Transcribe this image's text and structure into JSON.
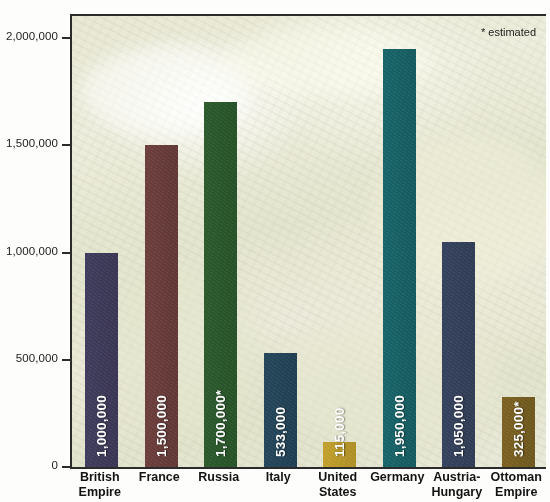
{
  "chart_data": {
    "type": "bar",
    "title": "",
    "subtitle": "",
    "xlabel": "",
    "ylabel": "",
    "ylim": [
      0,
      2000000
    ],
    "grid": false,
    "legend": "none",
    "annotations": [
      "* estimated"
    ],
    "y_ticks": [
      {
        "value": 2000000,
        "label": "2,000,000"
      },
      {
        "value": 1500000,
        "label": "1,500,000"
      },
      {
        "value": 1000000,
        "label": "1,000,000"
      },
      {
        "value": 500000,
        "label": "500,000"
      },
      {
        "value": 0,
        "label": "0"
      }
    ],
    "categories": [
      "British Empire",
      "France",
      "Russia",
      "Italy",
      "United States",
      "Germany",
      "Austria-Hungary",
      "Ottoman Empire"
    ],
    "values": [
      1000000,
      1500000,
      1700000,
      533000,
      115000,
      1950000,
      1050000,
      325000
    ],
    "data_labels": [
      "1,000,000",
      "1,500,000",
      "1,700,000*",
      "533,000",
      "115,000",
      "1,950,000",
      "1,050,000",
      "325,000*"
    ],
    "estimated_flags": [
      false,
      false,
      true,
      false,
      false,
      false,
      false,
      true
    ],
    "bar_colors": [
      "#413d5e",
      "#6e3f3d",
      "#2c5c2d",
      "#25475c",
      "#c5a22c",
      "#18666b",
      "#36435f",
      "#7d6322"
    ],
    "bars": [
      {
        "category": "British Empire",
        "label_line1": "British",
        "label_line2": "Empire",
        "value": 1000000,
        "data_label": "1,000,000",
        "color": "#413d5e"
      },
      {
        "category": "France",
        "label_line1": "France",
        "label_line2": "",
        "value": 1500000,
        "data_label": "1,500,000",
        "color": "#6e3f3d"
      },
      {
        "category": "Russia",
        "label_line1": "Russia",
        "label_line2": "",
        "value": 1700000,
        "data_label": "1,700,000*",
        "color": "#2c5c2d"
      },
      {
        "category": "Italy",
        "label_line1": "Italy",
        "label_line2": "",
        "value": 533000,
        "data_label": "533,000",
        "color": "#25475c"
      },
      {
        "category": "United States",
        "label_line1": "United",
        "label_line2": "States",
        "value": 115000,
        "data_label": "115,000",
        "color": "#c5a22c"
      },
      {
        "category": "Germany",
        "label_line1": "Germany",
        "label_line2": "",
        "value": 1950000,
        "data_label": "1,950,000",
        "color": "#18666b"
      },
      {
        "category": "Austria-Hungary",
        "label_line1": "Austria-",
        "label_line2": "Hungary",
        "value": 1050000,
        "data_label": "1,050,000",
        "color": "#36435f"
      },
      {
        "category": "Ottoman Empire",
        "label_line1": "Ottoman",
        "label_line2": "Empire",
        "value": 325000,
        "data_label": "325,000*",
        "color": "#7d6322"
      }
    ]
  },
  "note": {
    "estimated": "* estimated"
  }
}
